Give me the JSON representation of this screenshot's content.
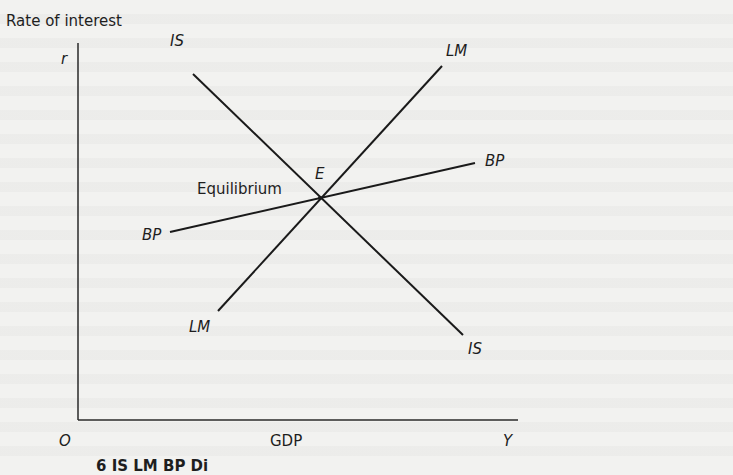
{
  "diagram": {
    "y_axis_title": "Rate of interest",
    "y_axis_symbol": "r",
    "x_axis_title": "GDP",
    "x_axis_symbol": "Y",
    "origin_label": "O",
    "equilibrium_label": "Equilibrium",
    "equilibrium_point_label": "E",
    "curves": {
      "is": {
        "label_top": "IS",
        "label_bottom": "IS"
      },
      "lm": {
        "label_top": "LM",
        "label_bottom": "LM"
      },
      "bp": {
        "label_left": "BP",
        "label_right": "BP"
      }
    },
    "caption_fragment": "6 IS LM BP Di"
  },
  "colors": {
    "background": "#f2f2f0",
    "ink": "#1e1e1e"
  }
}
